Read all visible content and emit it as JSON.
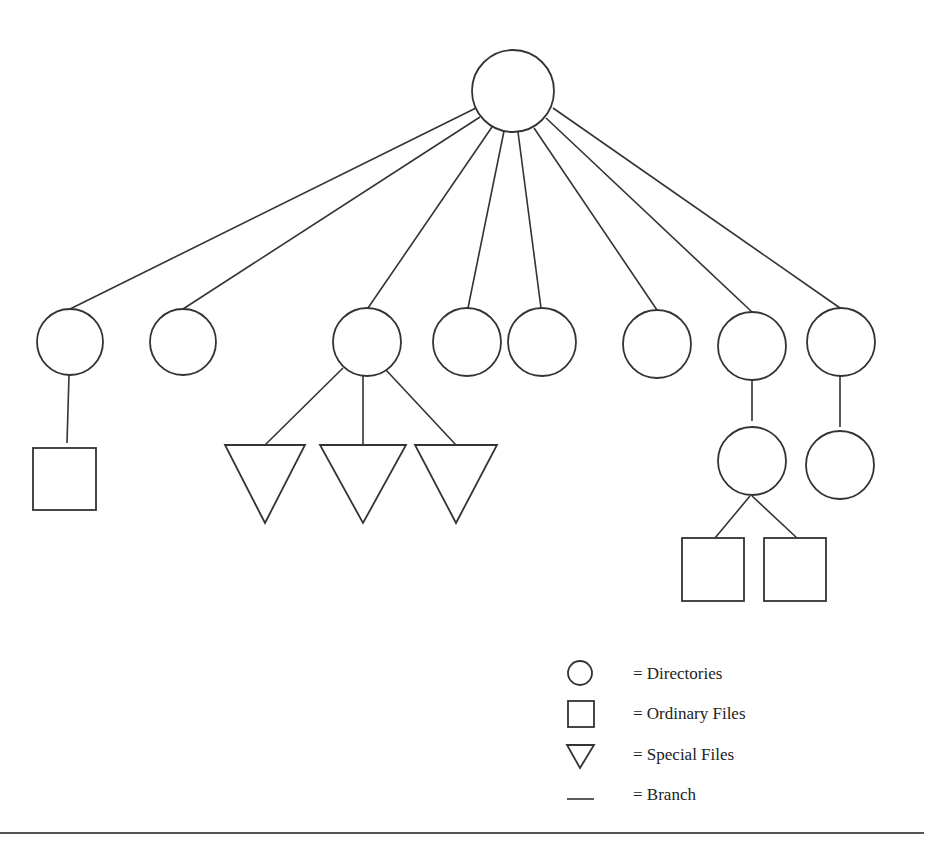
{
  "diagram": {
    "type": "tree",
    "root": {
      "id": "root",
      "shape": "circle",
      "cx": 513,
      "cy": 91,
      "r": 41
    },
    "nodes": [
      {
        "id": "d1",
        "shape": "circle",
        "cx": 70,
        "cy": 342,
        "r": 33
      },
      {
        "id": "d2",
        "shape": "circle",
        "cx": 183,
        "cy": 342,
        "r": 33
      },
      {
        "id": "d3",
        "shape": "circle",
        "cx": 367,
        "cy": 342,
        "r": 34
      },
      {
        "id": "d4",
        "shape": "circle",
        "cx": 467,
        "cy": 342,
        "r": 34
      },
      {
        "id": "d5",
        "shape": "circle",
        "cx": 542,
        "cy": 342,
        "r": 34
      },
      {
        "id": "d6",
        "shape": "circle",
        "cx": 657,
        "cy": 344,
        "r": 34
      },
      {
        "id": "d7",
        "shape": "circle",
        "cx": 752,
        "cy": 346,
        "r": 34
      },
      {
        "id": "d8",
        "shape": "circle",
        "cx": 841,
        "cy": 342,
        "r": 34
      },
      {
        "id": "d7a",
        "shape": "circle",
        "cx": 752,
        "cy": 461,
        "r": 34
      },
      {
        "id": "d8a",
        "shape": "circle",
        "cx": 840,
        "cy": 465,
        "r": 34
      },
      {
        "id": "f1",
        "shape": "square",
        "x": 33,
        "y": 448,
        "w": 63,
        "h": 62
      },
      {
        "id": "f2",
        "shape": "square",
        "x": 682,
        "y": 538,
        "w": 62,
        "h": 63
      },
      {
        "id": "f3",
        "shape": "square",
        "x": 764,
        "y": 538,
        "w": 62,
        "h": 63
      },
      {
        "id": "s1",
        "shape": "triangle",
        "cx": 265,
        "top": 445,
        "bottom": 523,
        "half": 40
      },
      {
        "id": "s2",
        "shape": "triangle",
        "cx": 363,
        "top": 445,
        "bottom": 523,
        "half": 43
      },
      {
        "id": "s3",
        "shape": "triangle",
        "cx": 456,
        "top": 445,
        "bottom": 523,
        "half": 41
      }
    ],
    "edges": [
      {
        "x1": 476,
        "y1": 108,
        "x2": 70,
        "y2": 309
      },
      {
        "x1": 480,
        "y1": 117,
        "x2": 183,
        "y2": 309
      },
      {
        "x1": 492,
        "y1": 127,
        "x2": 368,
        "y2": 308
      },
      {
        "x1": 504,
        "y1": 131,
        "x2": 468,
        "y2": 308
      },
      {
        "x1": 518,
        "y1": 132,
        "x2": 541,
        "y2": 308
      },
      {
        "x1": 534,
        "y1": 128,
        "x2": 657,
        "y2": 310
      },
      {
        "x1": 546,
        "y1": 118,
        "x2": 752,
        "y2": 312
      },
      {
        "x1": 553,
        "y1": 108,
        "x2": 840,
        "y2": 308
      },
      {
        "x1": 69,
        "y1": 375,
        "x2": 67,
        "y2": 443
      },
      {
        "x1": 343,
        "y1": 368,
        "x2": 265,
        "y2": 445
      },
      {
        "x1": 363,
        "y1": 376,
        "x2": 363,
        "y2": 445
      },
      {
        "x1": 386,
        "y1": 370,
        "x2": 456,
        "y2": 445
      },
      {
        "x1": 752,
        "y1": 380,
        "x2": 752,
        "y2": 421
      },
      {
        "x1": 840,
        "y1": 376,
        "x2": 840,
        "y2": 427
      },
      {
        "x1": 750,
        "y1": 496,
        "x2": 715,
        "y2": 538
      },
      {
        "x1": 752,
        "y1": 496,
        "x2": 797,
        "y2": 538
      }
    ]
  },
  "legend": {
    "items": [
      {
        "symbol": "circle",
        "label": "= Directories"
      },
      {
        "symbol": "square",
        "label": "= Ordinary Files"
      },
      {
        "symbol": "triangle",
        "label": "= Special Files"
      },
      {
        "symbol": "line",
        "label": "= Branch"
      }
    ]
  },
  "colors": {
    "stroke": "#333333",
    "background": "#ffffff"
  }
}
